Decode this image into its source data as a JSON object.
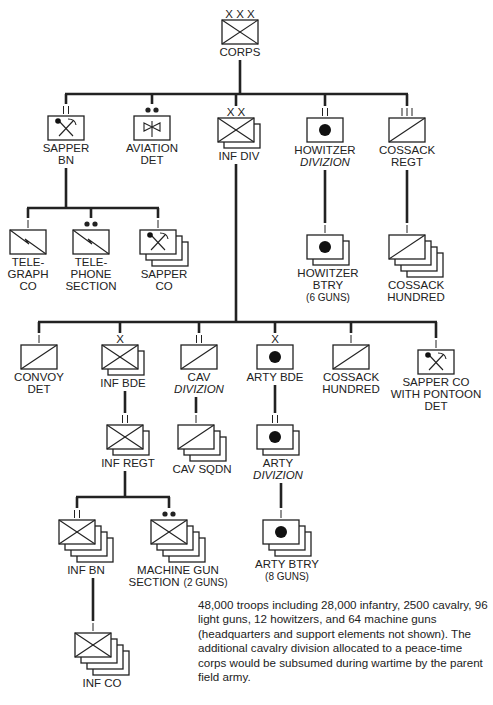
{
  "units": {
    "corps": {
      "echelon": "XXX",
      "type": "infantry",
      "lines": [
        "CORPS"
      ],
      "stack": 1
    },
    "sapper_bn": {
      "echelon": "II",
      "type": "sapper",
      "lines": [
        "SAPPER",
        "BN"
      ],
      "stack": 1
    },
    "aviation_det": {
      "echelon": "••",
      "type": "aviation",
      "lines": [
        "AVIATION",
        "DET"
      ],
      "stack": 1
    },
    "inf_div": {
      "echelon": "XX",
      "type": "infantry",
      "lines": [
        "INF DIV"
      ],
      "stack": 2
    },
    "howitzer_divizion": {
      "echelon": "II",
      "type": "artillery",
      "lines": [
        "HOWITZER",
        "DIVIZION"
      ],
      "italic_lines": [
        1
      ],
      "stack": 1
    },
    "cossack_regt": {
      "echelon": "III",
      "type": "cavalry",
      "lines": [
        "COSSACK",
        "REGT"
      ],
      "stack": 1
    },
    "telegraph_co": {
      "echelon": "I",
      "type": "signal",
      "lines": [
        "TELE-",
        "GRAPH",
        "CO"
      ],
      "stack": 1
    },
    "telephone_section": {
      "echelon": "••",
      "type": "signal",
      "lines": [
        "TELE-",
        "PHONE",
        "SECTION"
      ],
      "stack": 1
    },
    "sapper_co": {
      "echelon": "I",
      "type": "sapper",
      "lines": [
        "SAPPER",
        "CO"
      ],
      "stack": 3
    },
    "howitzer_btry": {
      "echelon": "I",
      "type": "artillery",
      "lines": [
        "HOWITZER",
        "BTRY",
        "(6 GUNS)"
      ],
      "small_lines": [
        2
      ],
      "stack": 2
    },
    "cossack_hundred_1": {
      "echelon": "I",
      "type": "cavalry",
      "lines": [
        "COSSACK",
        "HUNDRED"
      ],
      "stack": 4
    },
    "convoy_det": {
      "echelon": "I",
      "type": "cavalry",
      "lines": [
        "CONVOY",
        "DET"
      ],
      "stack": 1
    },
    "inf_bde": {
      "echelon": "X",
      "type": "infantry",
      "lines": [
        "INF BDE"
      ],
      "stack": 2
    },
    "cav_divizion": {
      "echelon": "II",
      "type": "cavalry",
      "lines": [
        "CAV",
        "DIVIZION"
      ],
      "italic_lines": [
        1
      ],
      "stack": 1
    },
    "arty_bde": {
      "echelon": "X",
      "type": "artillery",
      "lines": [
        "ARTY BDE"
      ],
      "stack": 1
    },
    "cossack_hundred_2": {
      "echelon": "I",
      "type": "cavalry",
      "lines": [
        "COSSACK",
        "HUNDRED"
      ],
      "stack": 1
    },
    "sapper_co_pontoon": {
      "echelon": "I",
      "type": "sapper",
      "lines": [
        "SAPPER CO",
        "WITH PONTOON",
        "DET"
      ],
      "stack": 1
    },
    "inf_regt": {
      "echelon": "II",
      "type": "infantry",
      "lines": [
        "INF REGT"
      ],
      "stack": 2
    },
    "cav_sqdn": {
      "echelon": "I",
      "type": "cavalry",
      "lines": [
        "CAV SQDN"
      ],
      "stack": 3
    },
    "arty_divizion": {
      "echelon": "II",
      "type": "artillery",
      "lines": [
        "ARTY",
        "DIVIZION"
      ],
      "italic_lines": [
        1
      ],
      "stack": 2
    },
    "inf_bn": {
      "echelon": "II",
      "type": "infantry",
      "lines": [
        "INF BN"
      ],
      "stack": 4
    },
    "machine_gun_section": {
      "echelon": "••",
      "type": "infantry",
      "lines": [
        "MACHINE GUN",
        "SECTION"
      ],
      "suffix": "(2 GUNS)",
      "stack": 4
    },
    "arty_btry": {
      "echelon": "I",
      "type": "artillery",
      "lines": [
        "ARTY BTRY",
        "(8 GUNS)"
      ],
      "small_lines": [
        1
      ],
      "stack": 3
    },
    "inf_co": {
      "echelon": "I",
      "type": "infantry",
      "lines": [
        "INF CO"
      ],
      "stack": 4
    }
  },
  "hierarchy": {
    "corps": [
      "sapper_bn",
      "aviation_det",
      "inf_div",
      "howitzer_divizion",
      "cossack_regt"
    ],
    "sapper_bn": [
      "telegraph_co",
      "telephone_section",
      "sapper_co"
    ],
    "howitzer_divizion": [
      "howitzer_btry"
    ],
    "cossack_regt": [
      "cossack_hundred_1"
    ],
    "inf_div": [
      "convoy_det",
      "inf_bde",
      "cav_divizion",
      "arty_bde",
      "cossack_hundred_2",
      "sapper_co_pontoon"
    ],
    "inf_bde": [
      "inf_regt"
    ],
    "cav_divizion": [
      "cav_sqdn"
    ],
    "arty_bde": [
      "arty_divizion"
    ],
    "arty_divizion": [
      "arty_btry"
    ],
    "inf_regt": [
      "inf_bn",
      "machine_gun_section"
    ],
    "inf_bn": [
      "inf_co"
    ]
  },
  "note": "48,000 troops including 28,000 infantry, 2500 cavalry, 96 light guns, 12 howitzers, and 64 machine guns (headquarters and support elements not shown). The additional cavalry division allocated to a peace-time corps would be subsumed during wartime by the parent field army."
}
